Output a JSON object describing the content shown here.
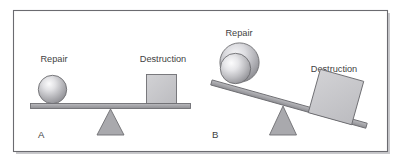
{
  "figure": {
    "background_color": "#ffffff",
    "frame": {
      "border_color": "#6b6b70",
      "fill_color": "#ffffff",
      "shadow_color": "#c9c9cc"
    },
    "palette": {
      "label_text": "#3f3f43",
      "beam_fill": "#a9a9ad",
      "beam_stroke": "#6e6e72",
      "fulcrum_fill": "#a9a9ad",
      "fulcrum_stroke": "#6e6e72",
      "box_fill": "#c6c6c8",
      "box_stroke": "#6e6e72",
      "sphere_light": "#f2f2f4",
      "sphere_mid": "#b9b9bd",
      "sphere_dark": "#8a8a8e",
      "sphere_stroke": "#6e6e72"
    },
    "panels": [
      {
        "id": "panel-a",
        "letter": "A",
        "state": "balanced",
        "beam_tilt_degrees": 0,
        "left_object": {
          "shape": "sphere",
          "label": "Repair",
          "relative_size": "small"
        },
        "right_object": {
          "shape": "square",
          "label": "Destruction",
          "relative_size": "small"
        }
      },
      {
        "id": "panel-b",
        "letter": "B",
        "state": "tilted-right",
        "beam_tilt_degrees": 16,
        "left_object": {
          "shape": "sphere",
          "label": "Repair",
          "relative_size": "large"
        },
        "right_object": {
          "shape": "square",
          "label": "Destruction",
          "relative_size": "large"
        }
      }
    ]
  }
}
